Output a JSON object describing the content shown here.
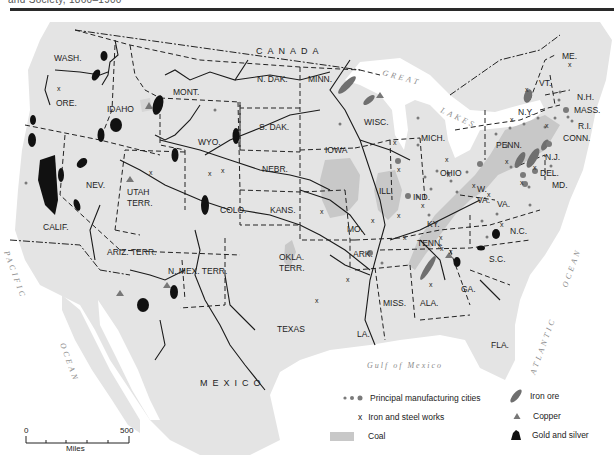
{
  "header": {
    "cut_text": "and Society, 1860–1900"
  },
  "map": {
    "countries": {
      "canada": "CANADA",
      "mexico": "MEXICO"
    },
    "states": {
      "wash": "WASH.",
      "ore": "ORE.",
      "idaho": "IDAHO",
      "mont": "MONT.",
      "wyo": "WYO.",
      "nev": "NEV.",
      "utah": "UTAH",
      "utah2": "TERR.",
      "calif": "CALIF.",
      "colo": "COLO.",
      "ariz": "ARIZ. TERR.",
      "nmex": "N. MEX. TERR.",
      "ndak": "N. DAK.",
      "sdak": "S. DAK.",
      "nebr": "NEBR.",
      "kans": "KANS.",
      "okla": "OKLA.",
      "okla2": "TERR.",
      "texas": "TEXAS",
      "minn": "MINN.",
      "iowa": "IOWA",
      "mo": "MO.",
      "ark": "ARK.",
      "la": "LA.",
      "wisc": "WISC.",
      "ill": "ILL.",
      "mich": "MICH.",
      "ind": "IND.",
      "ohio": "OHIO",
      "ky": "KY.",
      "tenn": "TENN.",
      "miss": "MISS.",
      "ala": "ALA.",
      "ga": "GA.",
      "fla": "FLA.",
      "wva": "W.",
      "wva2": "VA.",
      "va": "VA.",
      "nc": "N.C.",
      "sc": "S.C.",
      "penn": "PENN.",
      "ny": "N.Y.",
      "nj": "N.J.",
      "del": "DEL.",
      "md": "MD.",
      "vt": "VT.",
      "me": "ME.",
      "nh": "N.H.",
      "mass": "MASS.",
      "ri": "R.I.",
      "conn": "CONN."
    },
    "water": {
      "great": "GREAT",
      "lakes": "LAKES",
      "gulf": "Gulf of Mexico",
      "pacific": "PACIFIC",
      "pacific_ocean": "OCEAN",
      "atlantic": "ATLANTIC",
      "atlantic_ocean": "OCEAN"
    }
  },
  "legend": {
    "items": [
      {
        "symbol": "manufacturing-dots",
        "label": "Principal manufacturing cities"
      },
      {
        "symbol": "x-mark",
        "label": "Iron and steel works"
      },
      {
        "symbol": "coal-swatch",
        "label": "Coal"
      },
      {
        "symbol": "iron-ore-shape",
        "label": "Iron ore"
      },
      {
        "symbol": "triangle",
        "label": "Copper"
      },
      {
        "symbol": "gold-silver-shape",
        "label": "Gold and silver"
      }
    ],
    "x_glyph": "x"
  },
  "scale": {
    "start": "0",
    "end": "500",
    "unit": "Miles"
  },
  "colors": {
    "land": "#e4e4e4",
    "water": "#ffffff",
    "coal": "#c8c8c8",
    "iron_ore": "#6f6f6f",
    "gold_silver": "#111111",
    "copper": "#777777",
    "manufacturing": "#7a7a7a",
    "border": "#222222"
  }
}
